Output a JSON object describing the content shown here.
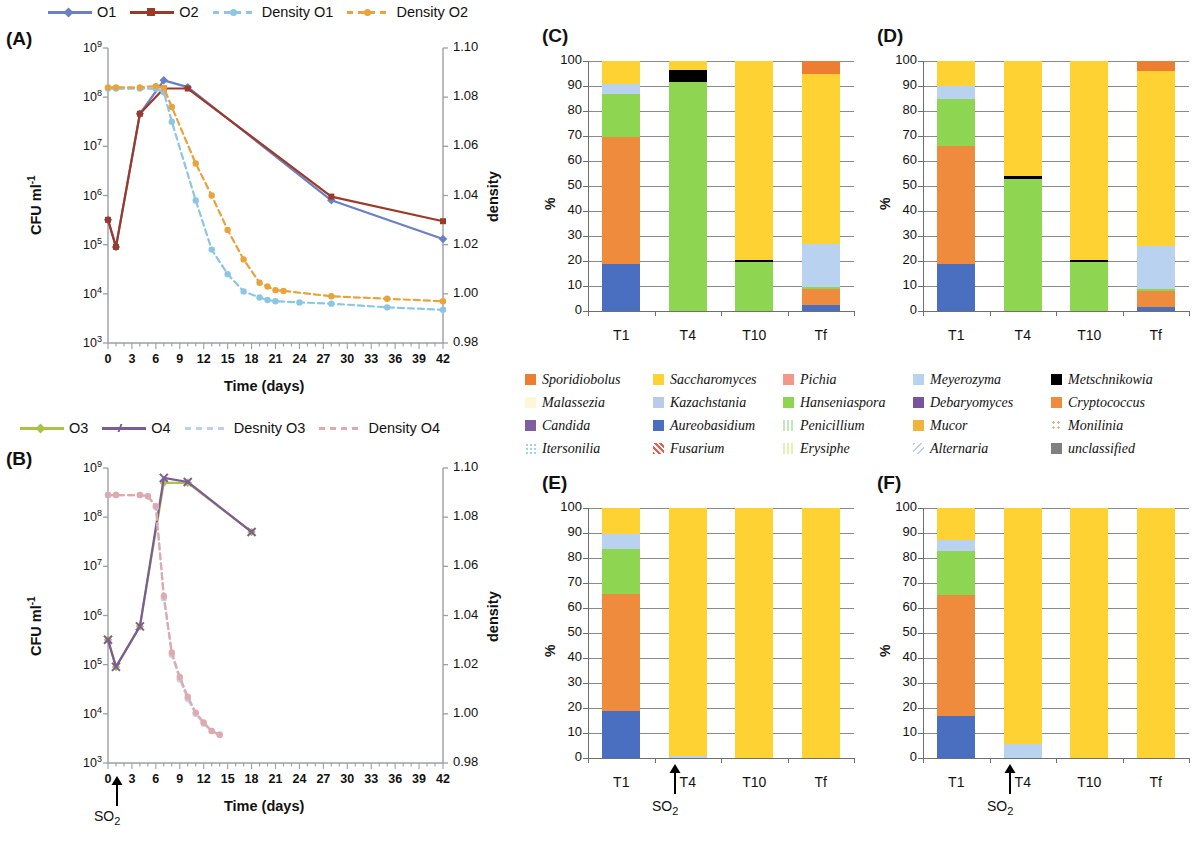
{
  "figure": {
    "panels": [
      "A",
      "B",
      "C",
      "D",
      "E",
      "F"
    ]
  },
  "panelA": {
    "tag": "(A)",
    "xlabel": "Time (days)",
    "ylabel_left": "CFU ml",
    "ylabel_left_sup": "-1",
    "ylabel_right": "density",
    "legend": [
      {
        "label": "O1",
        "color": "#6a7fc4",
        "style": "solid",
        "marker": "diamond"
      },
      {
        "label": "O2",
        "color": "#9c3a29",
        "style": "solid",
        "marker": "square"
      },
      {
        "label": "Density O1",
        "color": "#8cc6e4",
        "style": "dashed",
        "marker": "circle"
      },
      {
        "label": "Density O2",
        "color": "#e8a33d",
        "style": "dashed",
        "marker": "circle"
      }
    ],
    "xticks": [
      "0",
      "3",
      "6",
      "9",
      "12",
      "15",
      "18",
      "21",
      "24",
      "27",
      "30",
      "33",
      "36",
      "39",
      "42"
    ],
    "yticks_left": [
      "10⁹",
      "10⁸",
      "10⁷",
      "10⁶",
      "10⁵",
      "10⁴",
      "10³"
    ],
    "yticks_right": [
      "1.10",
      "1.08",
      "1.06",
      "1.04",
      "1.02",
      "1.00",
      "0.98"
    ]
  },
  "panelB": {
    "tag": "(B)",
    "xlabel": "Time (days)",
    "ylabel_left": "CFU ml",
    "ylabel_left_sup": "-1",
    "ylabel_right": "density",
    "so2_label": "SO",
    "so2_sub": "2",
    "legend": [
      {
        "label": "O3",
        "color": "#a8c24a",
        "style": "solid",
        "marker": "diamond"
      },
      {
        "label": "O4",
        "color": "#7c5c96",
        "style": "solid",
        "marker": "x"
      },
      {
        "label": "Desnity O3",
        "color": "#bcd2ea",
        "style": "dashed",
        "marker": "none"
      },
      {
        "label": "Density O4",
        "color": "#e0a9ad",
        "style": "dashed",
        "marker": "none"
      }
    ],
    "xticks": [
      "0",
      "3",
      "6",
      "9",
      "12",
      "15",
      "18",
      "21",
      "24",
      "27",
      "30",
      "33",
      "36",
      "39",
      "42"
    ],
    "yticks_left": [
      "10⁹",
      "10⁸",
      "10⁷",
      "10⁶",
      "10⁵",
      "10⁴",
      "10³"
    ],
    "yticks_right": [
      "1.10",
      "1.08",
      "1.06",
      "1.04",
      "1.02",
      "1.00",
      "0.98"
    ]
  },
  "panelC": {
    "tag": "(C)",
    "ylabel": "%",
    "categories": [
      "T1",
      "T4",
      "T10",
      "Tf"
    ]
  },
  "panelD": {
    "tag": "(D)",
    "ylabel": "%",
    "categories": [
      "T1",
      "T4",
      "T10",
      "Tf"
    ]
  },
  "panelE": {
    "tag": "(E)",
    "ylabel": "%",
    "categories": [
      "T1",
      "T4",
      "T10",
      "Tf"
    ],
    "so2_label": "SO",
    "so2_sub": "2"
  },
  "panelF": {
    "tag": "(F)",
    "ylabel": "%",
    "categories": [
      "T1",
      "T4",
      "T10",
      "Tf"
    ],
    "so2_label": "SO",
    "so2_sub": "2"
  },
  "species_legend": {
    "columns": [
      [
        {
          "name": "Sporidiobolus",
          "color": "#ed7d31",
          "pattern": "solid"
        },
        {
          "name": "Malassezia",
          "color": "#fdf7d8",
          "pattern": "solid"
        },
        {
          "name": "Candida",
          "color": "#7d5fa0",
          "pattern": "solid"
        },
        {
          "name": "Itersonilia",
          "color": "#9fd3ef",
          "pattern": "dots"
        }
      ],
      [
        {
          "name": "Saccharomyces",
          "color": "#ffd233",
          "pattern": "solid"
        },
        {
          "name": "Kazachstania",
          "color": "#b8cbe8",
          "pattern": "solid"
        },
        {
          "name": "Aureobasidium",
          "color": "#4b6fc0",
          "pattern": "solid"
        },
        {
          "name": "Fusarium",
          "color": "#e8604a",
          "pattern": "cross"
        }
      ],
      [
        {
          "name": "Pichia",
          "color": "#f2988a",
          "pattern": "solid"
        },
        {
          "name": "Hanseniaspora",
          "color": "#8ed552",
          "pattern": "solid"
        },
        {
          "name": "Penicillium",
          "color": "#bfe8c0",
          "pattern": "check"
        },
        {
          "name": "Erysiphe",
          "color": "#e2f0b4",
          "pattern": "vstripe"
        }
      ],
      [
        {
          "name": "Meyerozyma",
          "color": "#b8d2f0",
          "pattern": "solid"
        },
        {
          "name": "Debaryomyces",
          "color": "#7b52a0",
          "pattern": "solid"
        },
        {
          "name": "Mucor",
          "color": "#f2b23e",
          "pattern": "solid"
        },
        {
          "name": "Alternaria",
          "color": "#b7cfe8",
          "pattern": "diag"
        }
      ],
      [
        {
          "name": "Metschnikowia",
          "color": "#000000",
          "pattern": "solid"
        },
        {
          "name": "Cryptococcus",
          "color": "#ef8b3c",
          "pattern": "solid"
        },
        {
          "name": "Monilinia",
          "color": "#d8bd9a",
          "pattern": "floral"
        },
        {
          "name": "unclassified",
          "color": "#808080",
          "pattern": "solid"
        }
      ]
    ]
  },
  "chart_data": [
    {
      "type": "line",
      "panel": "A",
      "title": "(A)",
      "xlabel": "Time (days)",
      "ylabel": "CFU ml-1",
      "ylabel_secondary": "density",
      "xlim": [
        0,
        42
      ],
      "ylim_log": [
        1000,
        1000000000
      ],
      "ylim_secondary": [
        0.98,
        1.1
      ],
      "grid": false,
      "legend_position": "top",
      "series": [
        {
          "name": "O1",
          "axis": "left",
          "color": "#6a7fc4",
          "style": "solid",
          "x": [
            0,
            1,
            4,
            7,
            10,
            28,
            42
          ],
          "y": [
            320000.0,
            90000.0,
            46000000.0,
            220000000.0,
            160000000.0,
            800000.0,
            130000.0
          ]
        },
        {
          "name": "O2",
          "axis": "left",
          "color": "#9c3a29",
          "style": "solid",
          "x": [
            0,
            1,
            4,
            7,
            10,
            28,
            42
          ],
          "y": [
            320000.0,
            90000.0,
            46000000.0,
            150000000.0,
            150000000.0,
            950000.0,
            300000.0
          ]
        },
        {
          "name": "Density O1",
          "axis": "right",
          "color": "#8cc6e4",
          "style": "dashed",
          "x": [
            0,
            1,
            4,
            6,
            7,
            8,
            11,
            13,
            15,
            17,
            19,
            20,
            21,
            24,
            28,
            35,
            42
          ],
          "y": [
            1.0835,
            1.0835,
            1.0835,
            1.0835,
            1.082,
            1.07,
            1.038,
            1.018,
            1.008,
            1.001,
            0.9985,
            0.9975,
            0.997,
            0.9965,
            0.996,
            0.9945,
            0.9935
          ]
        },
        {
          "name": "Density O2",
          "axis": "right",
          "color": "#e8a33d",
          "style": "dashed",
          "x": [
            0,
            1,
            4,
            6,
            7,
            8,
            11,
            13,
            15,
            17,
            19,
            20,
            21,
            22,
            28,
            35,
            42
          ],
          "y": [
            1.084,
            1.084,
            1.084,
            1.0845,
            1.0838,
            1.076,
            1.053,
            1.04,
            1.026,
            1.014,
            1.0045,
            1.003,
            1.0015,
            1.0012,
            0.999,
            0.998,
            0.997
          ]
        }
      ]
    },
    {
      "type": "line",
      "panel": "B",
      "title": "(B)",
      "xlabel": "Time (days)",
      "ylabel": "CFU ml-1",
      "ylabel_secondary": "density",
      "xlim": [
        0,
        42
      ],
      "ylim_log": [
        1000,
        1000000000
      ],
      "ylim_secondary": [
        0.98,
        1.1
      ],
      "grid": false,
      "legend_position": "top",
      "annotation": {
        "text": "SO2",
        "x": 1
      },
      "series": [
        {
          "name": "O3",
          "axis": "left",
          "color": "#a8c24a",
          "style": "solid",
          "x": [
            0,
            1,
            4,
            7,
            10,
            18
          ],
          "y": [
            320000.0,
            90000.0,
            600000.0,
            500000000.0,
            500000000.0,
            50000000.0
          ]
        },
        {
          "name": "O4",
          "axis": "left",
          "color": "#7c5c96",
          "style": "solid",
          "x": [
            0,
            1,
            4,
            7,
            10,
            18
          ],
          "y": [
            320000.0,
            90000.0,
            600000.0,
            630000000.0,
            520000000.0,
            50000000.0
          ]
        },
        {
          "name": "Desnity O3",
          "axis": "right",
          "color": "#bcd2ea",
          "style": "dashed",
          "x": [
            0,
            1,
            4,
            5,
            6,
            7,
            8,
            9,
            10,
            11,
            12,
            13,
            14
          ],
          "y": [
            1.089,
            1.089,
            1.089,
            1.0885,
            1.084,
            1.047,
            1.024,
            1.014,
            1.006,
            1.0,
            0.996,
            0.993,
            0.9915
          ]
        },
        {
          "name": "Density O4",
          "axis": "right",
          "color": "#e0a9ad",
          "style": "dashed",
          "x": [
            0,
            1,
            4,
            5,
            6,
            7,
            8,
            9,
            10,
            11,
            12,
            13,
            14
          ],
          "y": [
            1.089,
            1.089,
            1.089,
            1.0885,
            1.0845,
            1.048,
            1.025,
            1.015,
            1.007,
            1.0005,
            0.9965,
            0.993,
            0.9915
          ]
        }
      ]
    },
    {
      "type": "bar",
      "subtype": "stacked-100",
      "panel": "C",
      "title": "(C)",
      "xlabel": "",
      "ylabel": "%",
      "ylim": [
        0,
        100
      ],
      "grid": true,
      "categories": [
        "T1",
        "T4",
        "T10",
        "Tf"
      ],
      "series": [
        {
          "name": "Aureobasidium",
          "color": "#4b6fc0",
          "values": [
            19.0,
            0.0,
            0.0,
            2.5
          ]
        },
        {
          "name": "Cryptococcus",
          "color": "#ef8b3c",
          "values": [
            50.5,
            0.0,
            0.0,
            6.3
          ]
        },
        {
          "name": "Hanseniaspora",
          "color": "#8ed552",
          "values": [
            17.5,
            91.5,
            19.5,
            0.7
          ]
        },
        {
          "name": "Metschnikowia",
          "color": "#000000",
          "values": [
            0.0,
            5.0,
            0.8,
            0.0
          ]
        },
        {
          "name": "Meyerozyma",
          "color": "#b8d2f0",
          "values": [
            3.8,
            0.0,
            0.0,
            17.5
          ]
        },
        {
          "name": "Saccharomyces",
          "color": "#ffd233",
          "values": [
            9.2,
            3.5,
            79.7,
            68.0
          ]
        },
        {
          "name": "Sporidiobolus",
          "color": "#ed7d31",
          "values": [
            0.0,
            0.0,
            0.0,
            5.0
          ]
        }
      ]
    },
    {
      "type": "bar",
      "subtype": "stacked-100",
      "panel": "D",
      "title": "(D)",
      "xlabel": "",
      "ylabel": "%",
      "ylim": [
        0,
        100
      ],
      "grid": true,
      "categories": [
        "T1",
        "T4",
        "T10",
        "Tf"
      ],
      "series": [
        {
          "name": "Aureobasidium",
          "color": "#4b6fc0",
          "values": [
            19.0,
            0.0,
            0.0,
            1.5
          ]
        },
        {
          "name": "Cryptococcus",
          "color": "#ef8b3c",
          "values": [
            47.0,
            0.0,
            0.0,
            6.5
          ]
        },
        {
          "name": "Hanseniaspora",
          "color": "#8ed552",
          "values": [
            19.0,
            53.0,
            19.5,
            1.0
          ]
        },
        {
          "name": "Metschnikowia",
          "color": "#000000",
          "values": [
            0.0,
            1.0,
            0.8,
            0.0
          ]
        },
        {
          "name": "Meyerozyma",
          "color": "#b8d2f0",
          "values": [
            5.0,
            0.0,
            0.0,
            17.0
          ]
        },
        {
          "name": "Saccharomyces",
          "color": "#ffd233",
          "values": [
            10.0,
            46.0,
            79.7,
            70.0
          ]
        },
        {
          "name": "Sporidiobolus",
          "color": "#ed7d31",
          "values": [
            0.0,
            0.0,
            0.0,
            4.0
          ]
        }
      ]
    },
    {
      "type": "bar",
      "subtype": "stacked-100",
      "panel": "E",
      "title": "(E)",
      "xlabel": "",
      "ylabel": "%",
      "ylim": [
        0,
        100
      ],
      "grid": true,
      "annotation": {
        "text": "SO2",
        "between": [
          "T1",
          "T4"
        ]
      },
      "categories": [
        "T1",
        "T4",
        "T10",
        "Tf"
      ],
      "series": [
        {
          "name": "Aureobasidium",
          "color": "#4b6fc0",
          "values": [
            19.0,
            0.0,
            0.0,
            0.0
          ]
        },
        {
          "name": "Cryptococcus",
          "color": "#ef8b3c",
          "values": [
            46.8,
            0.0,
            0.0,
            0.0
          ]
        },
        {
          "name": "Hanseniaspora",
          "color": "#8ed552",
          "values": [
            18.0,
            0.0,
            0.0,
            0.0
          ]
        },
        {
          "name": "Meyerozyma",
          "color": "#b8d2f0",
          "values": [
            6.0,
            0.8,
            0.0,
            0.0
          ]
        },
        {
          "name": "Saccharomyces",
          "color": "#ffd233",
          "values": [
            10.2,
            99.2,
            100.0,
            100.0
          ]
        }
      ]
    },
    {
      "type": "bar",
      "subtype": "stacked-100",
      "panel": "F",
      "title": "(F)",
      "xlabel": "",
      "ylabel": "%",
      "ylim": [
        0,
        100
      ],
      "grid": true,
      "annotation": {
        "text": "SO2",
        "between": [
          "T1",
          "T4"
        ]
      },
      "categories": [
        "T1",
        "T4",
        "T10",
        "Tf"
      ],
      "series": [
        {
          "name": "Aureobasidium",
          "color": "#4b6fc0",
          "values": [
            17.0,
            0.0,
            0.0,
            0.0
          ]
        },
        {
          "name": "Cryptococcus",
          "color": "#ef8b3c",
          "values": [
            48.2,
            0.0,
            0.0,
            0.0
          ]
        },
        {
          "name": "Hanseniaspora",
          "color": "#8ed552",
          "values": [
            17.5,
            0.0,
            0.0,
            0.0
          ]
        },
        {
          "name": "Meyerozyma",
          "color": "#b8d2f0",
          "values": [
            4.5,
            5.5,
            0.0,
            0.0
          ]
        },
        {
          "name": "Saccharomyces",
          "color": "#ffd233",
          "values": [
            12.8,
            94.5,
            100.0,
            100.0
          ]
        }
      ]
    }
  ]
}
